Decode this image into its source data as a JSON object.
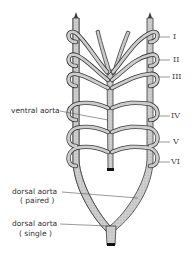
{
  "diagram": {
    "arch_labels": [
      "I",
      "II",
      "III",
      "IV",
      "V",
      "VI"
    ],
    "labels": {
      "ventral_aorta": "ventral aorta",
      "dorsal_aorta_paired_line1": "dorsal aorta",
      "dorsal_aorta_paired_line2": "( paired )",
      "dorsal_aorta_single_line1": "dorsal aorta",
      "dorsal_aorta_single_line2": "( single )"
    },
    "colors": {
      "vessel_fill": "#c9c9c9",
      "vessel_stroke": "#3a3a3a",
      "leader_line": "#555555",
      "vessel_end": "#111111"
    }
  }
}
